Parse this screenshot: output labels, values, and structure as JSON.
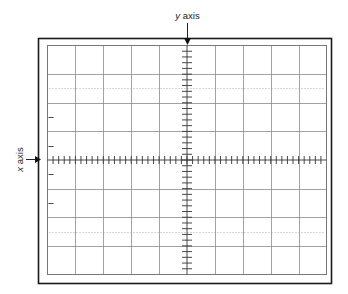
{
  "diagram": {
    "type": "oscilloscope-graticule",
    "y_axis_label": {
      "var": "y",
      "word": " axis"
    },
    "x_axis_label": {
      "var": "x",
      "word": " axis"
    },
    "grid": {
      "columns": 10,
      "rows": 8,
      "minor_divisions_per_major": 5,
      "dotted_rows": [
        1.5,
        6.5
      ],
      "left_edge_ticks": 4
    },
    "colors": {
      "frame": "#1a1a1a",
      "inner_border": "#777777",
      "grid_line": "#8a8a8a",
      "axis": "#333333",
      "dotted": "#999999"
    }
  }
}
